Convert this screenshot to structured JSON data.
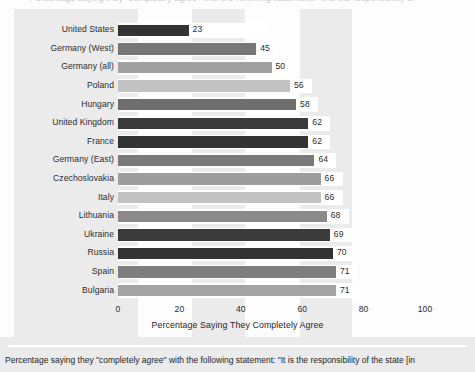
{
  "top_clip_text": "Percentage saying they \"completely agree\" with the following statement: \"It is the responsibility of",
  "chart_data": {
    "type": "bar",
    "orientation": "horizontal",
    "title": "",
    "xlabel": "Percentage Saying They Completely Agree",
    "ylabel": "",
    "xlim": [
      0,
      100
    ],
    "xticks": [
      0,
      20,
      40,
      60,
      80,
      100
    ],
    "xticklabels": [
      "0",
      "20",
      "40",
      "60",
      "80",
      "100"
    ],
    "grid": false,
    "legend": "none",
    "background_bands": true,
    "categories": [
      "United States",
      "Germany (West)",
      "Germany (all)",
      "Poland",
      "Hungary",
      "United Kingdom",
      "France",
      "Germany (East)",
      "Czechoslovakia",
      "Italy",
      "Lithuania",
      "Ukraine",
      "Russia",
      "Spain",
      "Bulgaria"
    ],
    "values": [
      23,
      45,
      50,
      56,
      58,
      62,
      62,
      64,
      66,
      66,
      68,
      69,
      70,
      71,
      71
    ],
    "value_labels": [
      "23",
      "45",
      "50",
      "56",
      "58",
      "62",
      "62",
      "64",
      "66",
      "66",
      "68",
      "69",
      "70",
      "71",
      "71"
    ],
    "bar_colors": [
      "#333333",
      "#767676",
      "#a0a0a0",
      "#c2c2c2",
      "#6e6e6e",
      "#3a3a3a",
      "#333333",
      "#7a7a7a",
      "#9d9d9d",
      "#c2c2c2",
      "#8a8a8a",
      "#3b3b3b",
      "#333333",
      "#7e7e7e",
      "#a3a3a3"
    ]
  },
  "caption": "Percentage saying they \"completely agree\" with the following statement: \"It is the responsibility of the state [in",
  "colors": {
    "page_background": "#ebebeb",
    "band": "#fdfdfd",
    "lane": "#ffffff",
    "text": "#1f1f1f",
    "divider": "#ffffff"
  }
}
